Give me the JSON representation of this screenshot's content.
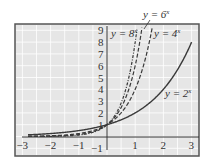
{
  "chart_data": {
    "type": "line",
    "title": "",
    "xlabel": "",
    "ylabel": "",
    "xlim": [
      -3,
      3
    ],
    "ylim": [
      -1,
      9
    ],
    "x_ticks": [
      "-3",
      "-2",
      "-1",
      "1",
      "2",
      "3"
    ],
    "y_ticks": [
      "-1",
      "1",
      "2",
      "3",
      "4",
      "5",
      "6",
      "7",
      "8",
      "9"
    ],
    "grid": true,
    "series": [
      {
        "name": "y = 2^x",
        "base": 2,
        "style": "solid",
        "label": "y = 2",
        "exp": "x"
      },
      {
        "name": "y = 4^x",
        "base": 4,
        "style": "dashed",
        "label": "y = 4",
        "exp": "x"
      },
      {
        "name": "y = 6^x",
        "base": 6,
        "style": "dashed",
        "label": "y = 6",
        "exp": "x"
      },
      {
        "name": "y = 8^x",
        "base": 8,
        "style": "dashdot",
        "label": "y = 8",
        "exp": "x"
      }
    ],
    "colors": {
      "background": "#e6e6e6",
      "grid": "#ffffff",
      "curve": "#3a3a3a",
      "axis": "#333333",
      "frame": "#555555"
    }
  }
}
